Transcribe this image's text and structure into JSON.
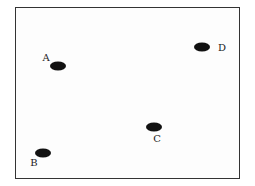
{
  "diagram": {
    "points": [
      {
        "id": "A",
        "label": "A",
        "x": 58,
        "y": 66,
        "label_x": 46,
        "label_y": 58
      },
      {
        "id": "B",
        "label": "B",
        "x": 43,
        "y": 153,
        "label_x": 34,
        "label_y": 163
      },
      {
        "id": "C",
        "label": "C",
        "x": 154,
        "y": 127,
        "label_x": 157,
        "label_y": 139
      },
      {
        "id": "D",
        "label": "D",
        "x": 202,
        "y": 47,
        "label_x": 222,
        "label_y": 48
      }
    ]
  }
}
